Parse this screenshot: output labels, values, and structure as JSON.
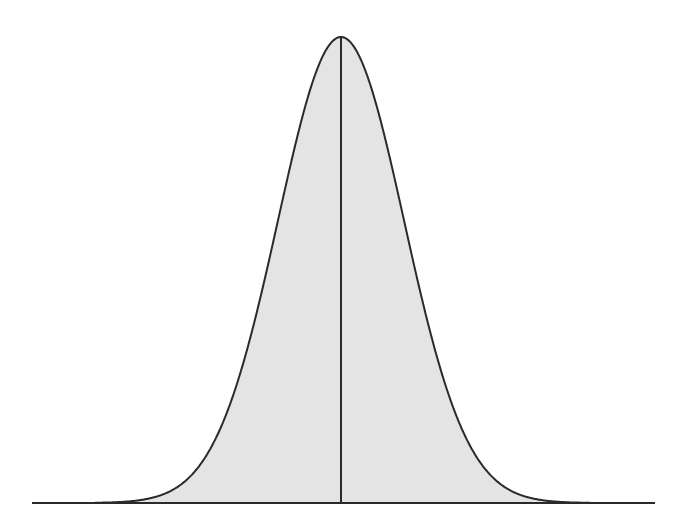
{
  "diagram": {
    "type": "normal-distribution-curve",
    "colors": {
      "background": "#ffffff",
      "fill": "#e4e4e4",
      "stroke": "#2a2a2a"
    },
    "geometry": {
      "baseline_y": 503,
      "baseline_x_start": 32,
      "baseline_x_end": 655,
      "mean_x": 341,
      "peak_y": 37,
      "sigma_px": 63
    },
    "mean_line": {
      "visible": true
    }
  }
}
